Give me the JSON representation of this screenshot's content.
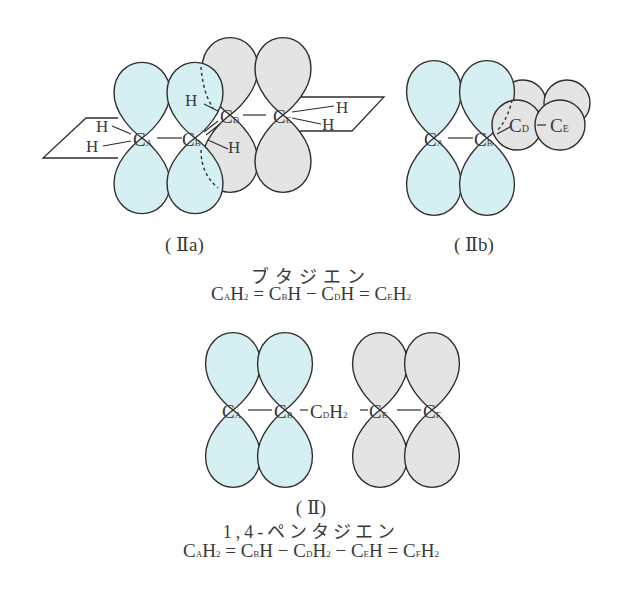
{
  "colors": {
    "blue_lobe": "#d6eff2",
    "gray_lobe": "#e4e4e4",
    "stroke": "#2e2e2e"
  },
  "diagram_a": {
    "caption": "( Ⅱa)",
    "atoms": {
      "ca": "C",
      "ca_sub": "A",
      "cb": "C",
      "cb_sub": "B",
      "cd": "C",
      "cd_sub": "D",
      "ce": "C",
      "ce_sub": "E"
    },
    "hydrogens": [
      "H",
      "H",
      "H",
      "H",
      "H",
      "H"
    ]
  },
  "diagram_b": {
    "caption": "( Ⅱb)",
    "atoms": {
      "ca": "C",
      "ca_sub": "A",
      "cb": "C",
      "cb_sub": "B",
      "cd": "C",
      "cd_sub": "D",
      "ce": "C",
      "ce_sub": "E"
    }
  },
  "butadiene": {
    "name": "ブタジエン",
    "formula": [
      {
        "t": "C"
      },
      {
        "s": "A"
      },
      {
        "t": "H"
      },
      {
        "s": "2"
      },
      {
        "t": " = "
      },
      {
        "t": "C"
      },
      {
        "s": "B"
      },
      {
        "t": "H − "
      },
      {
        "t": "C"
      },
      {
        "s": "D"
      },
      {
        "t": "H = "
      },
      {
        "t": "C"
      },
      {
        "s": "E"
      },
      {
        "t": "H"
      },
      {
        "s": "2"
      }
    ]
  },
  "diagram_c": {
    "caption": "( Ⅱ)",
    "atoms": {
      "ca": "C",
      "ca_sub": "A",
      "cb": "C",
      "cb_sub": "B",
      "cd": "C",
      "cd_sub": "D",
      "cd_h": "H",
      "cd_h_sub": "2",
      "ce": "C",
      "ce_sub": "E",
      "cf": "C",
      "cf_sub": "F"
    }
  },
  "pentadiene": {
    "name": "1,4-ペンタジエン",
    "formula": [
      {
        "t": "C"
      },
      {
        "s": "A"
      },
      {
        "t": "H"
      },
      {
        "s": "2"
      },
      {
        "t": " = "
      },
      {
        "t": "C"
      },
      {
        "s": "B"
      },
      {
        "t": "H −  "
      },
      {
        "t": "C"
      },
      {
        "s": "D"
      },
      {
        "t": "H"
      },
      {
        "s": "2"
      },
      {
        "t": " − "
      },
      {
        "t": "C"
      },
      {
        "s": "E"
      },
      {
        "t": "H = "
      },
      {
        "t": "C"
      },
      {
        "s": "F"
      },
      {
        "t": "H"
      },
      {
        "s": "2"
      }
    ]
  }
}
